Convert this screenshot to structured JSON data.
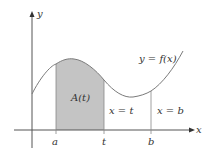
{
  "diagram": {
    "axes": {
      "x_label": "x",
      "y_label": "y"
    },
    "curve_label": "y = f(x)",
    "area_label": "A(t)",
    "vertical_lines": [
      {
        "label": "x = t",
        "tick": "t"
      },
      {
        "label": "x = b",
        "tick": "b"
      }
    ],
    "ticks": [
      "a",
      "t",
      "b"
    ],
    "colors": {
      "shade": "#c4c4c4",
      "curve": "#7a7a7a",
      "axis": "#555555"
    }
  }
}
